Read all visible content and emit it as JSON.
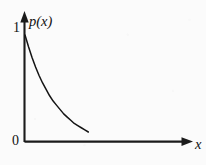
{
  "figure": {
    "background_color": "#fbfbfb",
    "ink_color": "#141414",
    "y_axis_label": "p(x)",
    "x_axis_label": "x",
    "y_tick_top_label": "1",
    "origin_label": "0"
  },
  "chart_data": {
    "type": "line",
    "title": "",
    "subtitle": "",
    "xlabel": "x",
    "ylabel": "p(x)",
    "legend": [],
    "legend_position": "none",
    "grid": false,
    "axis_style": "arrow-tipped open axes",
    "xlim": [
      0,
      1.62
    ],
    "ylim": [
      0,
      1.08
    ],
    "xticks": [
      0
    ],
    "xtick_labels": [
      "0"
    ],
    "yticks": [
      0,
      1
    ],
    "ytick_labels": [
      "0",
      "1"
    ],
    "annotations": [],
    "series": [
      {
        "name": "p(x)",
        "description": "monotonically decreasing convex curve, exponential decay from 1 at x=0 toward 0",
        "color": "#141414",
        "x": [
          0.0,
          0.05,
          0.1,
          0.15,
          0.2,
          0.25,
          0.3,
          0.35,
          0.4,
          0.45,
          0.5,
          0.55,
          0.6,
          0.65,
          0.7,
          0.75,
          0.8,
          0.85,
          0.9
        ],
        "y": [
          1.0,
          0.89,
          0.79,
          0.7,
          0.62,
          0.55,
          0.49,
          0.43,
          0.38,
          0.34,
          0.3,
          0.26,
          0.23,
          0.2,
          0.17,
          0.15,
          0.13,
          0.11,
          0.09
        ]
      }
    ]
  }
}
